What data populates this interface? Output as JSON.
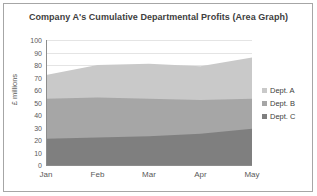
{
  "chart_data": {
    "type": "area",
    "title": "Company A's Cumulative Departmental Profits (Area Graph)",
    "subtitle": "",
    "xlabel": "",
    "ylabel": "£ millions",
    "stacked": true,
    "grid": true,
    "legend_position": "right",
    "categories": [
      "Jan",
      "Feb",
      "Mar",
      "Apr",
      "May"
    ],
    "ylim": [
      0,
      100
    ],
    "ytick_step": 10,
    "ytick_labels": [
      "100",
      "90",
      "80",
      "70",
      "60",
      "50",
      "40",
      "30",
      "20",
      "10",
      "0"
    ],
    "ytick_values": [
      100,
      90,
      80,
      70,
      60,
      50,
      40,
      30,
      20,
      10,
      0
    ],
    "series": [
      {
        "name": "Dept. C",
        "color": "#7f7f7f",
        "values": [
          21,
          22,
          23,
          25,
          29
        ],
        "cumulative": [
          21,
          22,
          23,
          25,
          29
        ]
      },
      {
        "name": "Dept. B",
        "color": "#a6a6a6",
        "values": [
          32,
          32,
          30,
          27,
          24
        ],
        "cumulative": [
          53,
          54,
          53,
          52,
          53
        ]
      },
      {
        "name": "Dept. A",
        "color": "#c9c9c9",
        "values": [
          19,
          26,
          28,
          27,
          33
        ],
        "cumulative": [
          72,
          80,
          81,
          79,
          86
        ]
      }
    ]
  },
  "legend": {
    "items": [
      {
        "label": "Dept. A",
        "color": "#c9c9c9"
      },
      {
        "label": "Dept. B",
        "color": "#a6a6a6"
      },
      {
        "label": "Dept. C",
        "color": "#7f7f7f"
      }
    ]
  },
  "colors": {
    "dept_a": "#c9c9c9",
    "dept_b": "#a6a6a6",
    "dept_c": "#7f7f7f",
    "gridline": "#e4e4e4",
    "axis": "#8c8c8c",
    "text": "#595959",
    "title_text": "#404040",
    "border": "#a6a6a6",
    "background": "#ffffff"
  }
}
